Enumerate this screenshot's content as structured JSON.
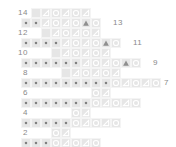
{
  "chart": {
    "cell_size_px": 10,
    "colors": {
      "cell_background": "#e6e6e6",
      "grid_line": "#f4f4f4",
      "symbol_outline": "#ffffff",
      "symbol_filled": "#8f8f8f",
      "dot": "#808080",
      "label_text": "#8a8a8a",
      "page_background": "#ffffff"
    },
    "symbol_legend": {
      "dot": "purl / knit dot stitch",
      "circle": "yarn over",
      "triangle": "decrease (left-leaning)",
      "triangle-filled": "double decrease",
      "blank": "empty square"
    },
    "row_numbers_left": [
      14,
      12,
      10,
      8,
      6,
      4,
      2
    ],
    "row_numbers_right": [
      13,
      11,
      9,
      7,
      5,
      3,
      1
    ],
    "rows": [
      {
        "number": 14,
        "side": "left",
        "top": 8,
        "cells_left": 31,
        "label_left": 6,
        "label_width": 22,
        "cells": [
          "blank",
          "triangle",
          "circle",
          "triangle",
          "circle",
          "triangle"
        ]
      },
      {
        "number": 13,
        "side": "right",
        "top": 18,
        "cells_left": 21,
        "label_left": 113,
        "label_width": 22,
        "cells": [
          "dot",
          "dot",
          "triangle",
          "circle",
          "triangle",
          "circle",
          "triangle-filled",
          "circle"
        ]
      },
      {
        "number": 12,
        "side": "left",
        "top": 28,
        "cells_left": 41,
        "label_left": 6,
        "label_width": 22,
        "cells": [
          "blank",
          "triangle",
          "circle",
          "triangle",
          "circle",
          "triangle"
        ]
      },
      {
        "number": 11,
        "side": "right",
        "top": 38,
        "cells_left": 21,
        "label_left": 133,
        "label_width": 22,
        "cells": [
          "dot",
          "dot",
          "dot",
          "dot",
          "triangle",
          "circle",
          "triangle",
          "circle",
          "triangle-filled",
          "circle"
        ]
      },
      {
        "number": 10,
        "side": "left",
        "top": 48,
        "cells_left": 51,
        "label_left": 6,
        "label_width": 22,
        "cells": [
          "blank",
          "triangle",
          "circle",
          "triangle",
          "circle",
          "triangle"
        ]
      },
      {
        "number": 9,
        "side": "right",
        "top": 58,
        "cells_left": 21,
        "label_left": 153,
        "label_width": 20,
        "cells": [
          "dot",
          "dot",
          "dot",
          "dot",
          "dot",
          "dot",
          "triangle",
          "circle",
          "triangle",
          "circle",
          "triangle-filled",
          "circle"
        ]
      },
      {
        "number": 8,
        "side": "left",
        "top": 68,
        "cells_left": 61,
        "label_left": 6,
        "label_width": 22,
        "cells": [
          "blank",
          "triangle",
          "circle",
          "triangle",
          "circle",
          "triangle"
        ]
      },
      {
        "number": 7,
        "side": "right",
        "top": 78,
        "cells_left": 21,
        "label_left": 164,
        "label_width": 12,
        "cells": [
          "dot",
          "dot",
          "dot",
          "dot",
          "dot",
          "dot",
          "dot",
          "dot",
          "dot",
          "circle",
          "triangle",
          "circle",
          "triangle",
          "circle"
        ]
      },
      {
        "number": 6,
        "side": "left",
        "top": 88,
        "cells_left": 91,
        "label_left": 6,
        "label_width": 22,
        "cells": [
          "circle",
          "triangle"
        ]
      },
      {
        "number": 5,
        "side": "right",
        "top": 98,
        "cells_left": 21,
        "label_left": 133,
        "label_width": 22,
        "cells": [
          "dot",
          "dot",
          "dot",
          "dot",
          "dot",
          "dot",
          "dot",
          "circle",
          "triangle",
          "circle",
          "triangle",
          "circle"
        ]
      },
      {
        "number": 4,
        "side": "left",
        "top": 108,
        "cells_left": 71,
        "label_left": 6,
        "label_width": 22,
        "cells": [
          "circle",
          "triangle"
        ]
      },
      {
        "number": 3,
        "side": "right",
        "top": 118,
        "cells_left": 21,
        "label_left": 112,
        "label_width": 22,
        "cells": [
          "dot",
          "dot",
          "dot",
          "dot",
          "dot",
          "circle",
          "triangle",
          "circle",
          "triangle",
          "circle"
        ]
      },
      {
        "number": 2,
        "side": "left",
        "top": 128,
        "cells_left": 51,
        "label_left": 6,
        "label_width": 22,
        "cells": [
          "circle",
          "triangle"
        ]
      },
      {
        "number": 1,
        "side": "right",
        "top": 138,
        "cells_left": 21,
        "label_left": 92,
        "label_width": 22,
        "cells": [
          "dot",
          "dot",
          "dot",
          "circle",
          "triangle",
          "circle",
          "triangle",
          "circle"
        ]
      }
    ]
  }
}
